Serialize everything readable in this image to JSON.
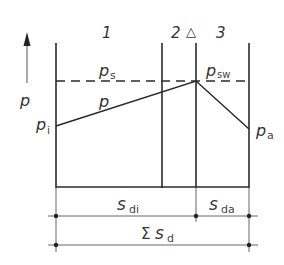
{
  "diagram": {
    "type": "pressure-profile-through-wall-layers",
    "layers": [
      {
        "id": "1",
        "label": "1"
      },
      {
        "id": "2",
        "label": "2"
      },
      {
        "id": "3",
        "label": "3"
      }
    ],
    "barrier_marker": "△",
    "axis": {
      "label": "p",
      "direction": "up"
    },
    "labels": {
      "p_s": {
        "base": "p",
        "sub": "s"
      },
      "p": {
        "base": "p",
        "sub": ""
      },
      "p_sw": {
        "base": "p",
        "sub": "sw"
      },
      "p_i": {
        "base": "p",
        "sub": "i"
      },
      "p_a": {
        "base": "p",
        "sub": "a"
      }
    },
    "dimensions": {
      "s_di": {
        "base": "s",
        "sub": "di"
      },
      "s_da": {
        "base": "s",
        "sub": "da"
      },
      "sum_s_d": {
        "prefix": "Σ",
        "base": "s",
        "sub": "d"
      }
    },
    "colors": {
      "line": "#2a2a2a",
      "thin_line": "#555555",
      "text": "#333333",
      "background": "#ffffff"
    }
  }
}
